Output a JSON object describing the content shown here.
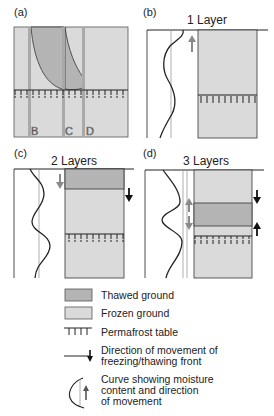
{
  "panels": {
    "a": {
      "label": "(a)",
      "markers": [
        "B",
        "C",
        "D"
      ]
    },
    "b": {
      "label": "(b)",
      "title": "1 Layer"
    },
    "c": {
      "label": "(c)",
      "title": "2 Layers"
    },
    "d": {
      "label": "(d)",
      "title": "3 Layers"
    }
  },
  "legend": {
    "thawed": "Thawed ground",
    "frozen": "Frozen ground",
    "permafrost": "Permafrost table",
    "front_line1": "Direction of movement of",
    "front_line2": "freezing/thawing front",
    "curve_line1": "Curve showing moisture",
    "curve_line2": "content and direction",
    "curve_line3": "of movement"
  },
  "colors": {
    "thawed": "#b4b4b4",
    "frozen": "#dadada",
    "outline": "#333333",
    "marker_bar": "#a9a9a9",
    "arrow_gray": "#8a8a8a"
  }
}
